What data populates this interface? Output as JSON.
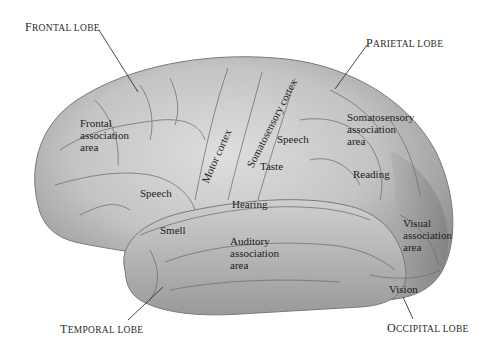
{
  "figure": {
    "colors": {
      "background": "#ffffff",
      "brain_light": "#d4d4d4",
      "brain_mid": "#b8b8b8",
      "brain_dark": "#8e8e8e",
      "sulcus_line": "#6f6f6f",
      "leader_line": "#333333",
      "text": "#1c1c1c"
    }
  },
  "lobes": {
    "frontal": {
      "first": "F",
      "rest": "rontal lobe"
    },
    "parietal": {
      "first": "P",
      "rest": "arietal lobe"
    },
    "temporal": {
      "first": "T",
      "rest": "emporal lobe"
    },
    "occipital": {
      "first": "O",
      "rest": "ccipital lobe"
    }
  },
  "areas": {
    "frontal_association": [
      "Frontal",
      "association",
      "area"
    ],
    "motor_cortex": "Motor cortex",
    "somatosensory_cortex": "Somatosensory cortex",
    "speech_parietal": "Speech",
    "taste": "Taste",
    "somatosensory_association": [
      "Somatosensory",
      "association",
      "area"
    ],
    "reading": "Reading",
    "speech_frontal": "Speech",
    "hearing": "Hearing",
    "smell": "Smell",
    "auditory_association": [
      "Auditory",
      "association",
      "area"
    ],
    "visual_association": [
      "Visual",
      "association",
      "area"
    ],
    "vision": "Vision"
  }
}
